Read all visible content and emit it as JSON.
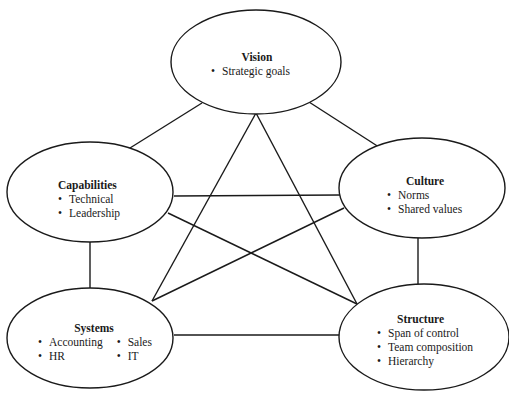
{
  "diagram": {
    "type": "network",
    "stroke_color": "#1a1a1a",
    "fill_color": "#ffffff",
    "nodes": [
      {
        "id": "vision",
        "title": "Vision",
        "items": [
          "Strategic goals"
        ]
      },
      {
        "id": "capabilities",
        "title": "Capabilities",
        "items": [
          "Technical",
          "Leadership"
        ]
      },
      {
        "id": "culture",
        "title": "Culture",
        "items": [
          "Norms",
          "Shared values"
        ]
      },
      {
        "id": "systems",
        "title": "Systems",
        "items": [
          "Accounting",
          "HR",
          "Sales",
          "IT"
        ],
        "columns": [
          [
            "Accounting",
            "HR"
          ],
          [
            "Sales",
            "IT"
          ]
        ]
      },
      {
        "id": "structure",
        "title": "Structure",
        "items": [
          "Span of control",
          "Team composition",
          "Hierarchy"
        ]
      }
    ],
    "edges": [
      [
        "vision",
        "capabilities"
      ],
      [
        "vision",
        "culture"
      ],
      [
        "vision",
        "systems"
      ],
      [
        "vision",
        "structure"
      ],
      [
        "capabilities",
        "culture"
      ],
      [
        "capabilities",
        "structure"
      ],
      [
        "capabilities",
        "systems"
      ],
      [
        "culture",
        "systems"
      ],
      [
        "culture",
        "structure"
      ],
      [
        "systems",
        "structure"
      ]
    ]
  }
}
